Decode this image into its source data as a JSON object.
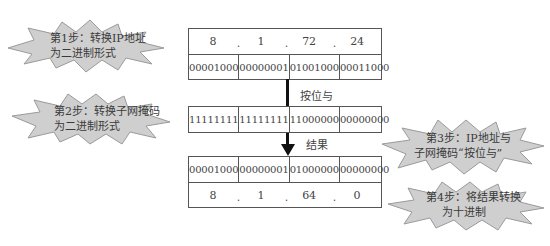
{
  "steps": [
    {
      "id": "step1",
      "line1": "第1步：转换IP地址",
      "line2": "为二进制形式"
    },
    {
      "id": "step2",
      "line1": "第2步：转换子网掩码",
      "line2": "为二进制形式"
    },
    {
      "id": "step3",
      "line1": "第3步：IP地址与",
      "line2": "子网掩码“按位与”"
    },
    {
      "id": "step4",
      "line1": "第4步：将结果转换",
      "line2": "为十进制"
    }
  ],
  "ip_table": {
    "decimal": [
      "8",
      "1",
      "72",
      "24"
    ],
    "separator": ".",
    "binary": [
      "00001000",
      "00000001",
      "01001000",
      "00011000"
    ]
  },
  "operation_label": "按位与",
  "mask_row": {
    "binary": [
      "11111111",
      "11111111",
      "11000000",
      "00000000"
    ]
  },
  "result_label": "结果",
  "result_table": {
    "binary": [
      "00001000",
      "00000001",
      "01000000",
      "00000000"
    ],
    "decimal": [
      "8",
      "1",
      "64",
      "0"
    ],
    "separator": "."
  },
  "colors": {
    "burst_fill": "#cfcfcf",
    "burst_stroke": "#9a9a9a",
    "table_border": "#555555",
    "arrow": "#111111"
  }
}
